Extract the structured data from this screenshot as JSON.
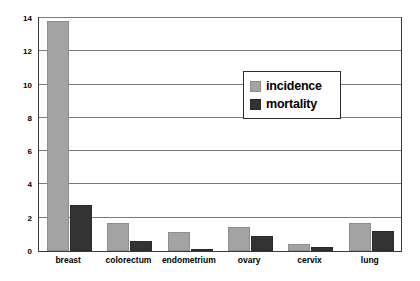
{
  "chart_data": {
    "type": "bar",
    "title": "",
    "subtitle": "",
    "xlabel": "",
    "ylabel": "",
    "categories": [
      "breast",
      "colorectum",
      "endometrium",
      "ovary",
      "cervix",
      "lung"
    ],
    "series": [
      {
        "name": "incidence",
        "color": "#a3a3a3",
        "values": [
          13.8,
          1.7,
          1.15,
          1.45,
          0.45,
          1.7
        ]
      },
      {
        "name": "mortality",
        "color": "#333333",
        "values": [
          2.75,
          0.6,
          0.08,
          0.88,
          0.25,
          1.18
        ]
      }
    ],
    "ylim": [
      0,
      14
    ],
    "yticks": [
      0,
      2,
      4,
      6,
      8,
      10,
      12,
      14
    ],
    "ytick_labels": [
      "0",
      "2",
      "4",
      "6",
      "8",
      "10",
      "12",
      "14"
    ],
    "grid": true,
    "grid_axis": "y",
    "legend_position": "upper-right-inside",
    "legend_entries": [
      "incidence",
      "mortality"
    ],
    "annotations": [],
    "frame": true,
    "background_color": "#ffffff",
    "axis_color": "#3a3a3a",
    "gridline_color": "#7a7a7a"
  }
}
